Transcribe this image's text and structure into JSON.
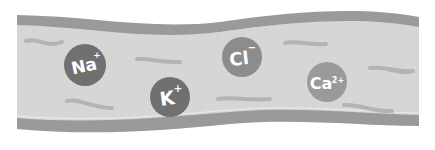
{
  "diagram": {
    "colors": {
      "background": "#ffffff",
      "vessel_wall": "#9a9a9a",
      "vessel_lumen": "#d8d8d8",
      "squiggle": "#b4b4b4"
    },
    "ions": [
      {
        "id": "sodium",
        "symbol": "Na",
        "charge": "+",
        "cx": 85,
        "cy": 65,
        "r": 21,
        "color": "#707070",
        "rot": -12
      },
      {
        "id": "potassium",
        "symbol": "K",
        "charge": "+",
        "cx": 170,
        "cy": 97,
        "r": 20,
        "color": "#707070",
        "rot": -8
      },
      {
        "id": "chloride",
        "symbol": "Cl",
        "charge": "−",
        "cx": 242,
        "cy": 57,
        "r": 20,
        "color": "#8c8c8c",
        "rot": -6
      },
      {
        "id": "calcium",
        "symbol": "Ca",
        "charge": "2+",
        "cx": 327,
        "cy": 82,
        "r": 20,
        "color": "#9a9a9a",
        "rot": 0
      }
    ]
  }
}
